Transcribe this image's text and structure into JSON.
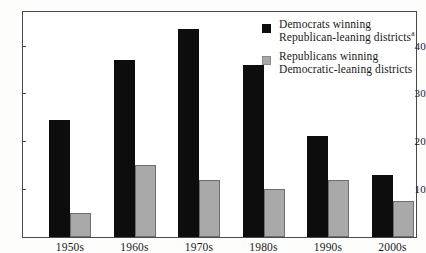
{
  "chart_data": {
    "type": "bar",
    "title": "",
    "xlabel": "",
    "ylabel": "",
    "categories": [
      "1950s",
      "1960s",
      "1970s",
      "1980s",
      "1990s",
      "2000s"
    ],
    "series": [
      {
        "name": "Democrats winning Republican-leaning districts",
        "color": "#0d0d0d",
        "values": [
          24.5,
          37,
          43.5,
          36,
          21,
          13
        ]
      },
      {
        "name": "Republicans winning Democratic-leaning districts",
        "color": "#a9a9a9",
        "values": [
          5,
          15,
          12,
          10,
          12,
          7.5
        ]
      }
    ],
    "yticks": [
      10,
      20,
      30,
      40
    ],
    "ylim": [
      0,
      47
    ],
    "grid": false,
    "legend_position": "top-right"
  },
  "legend": {
    "entries": [
      {
        "swatch": "dem",
        "line1": "Democrats winning",
        "line2": "Republican-leaning districts",
        "footnote": "a"
      },
      {
        "swatch": "rep",
        "line1": "Republicans winning",
        "line2": "Democratic-leaning districts",
        "footnote": ""
      }
    ]
  }
}
